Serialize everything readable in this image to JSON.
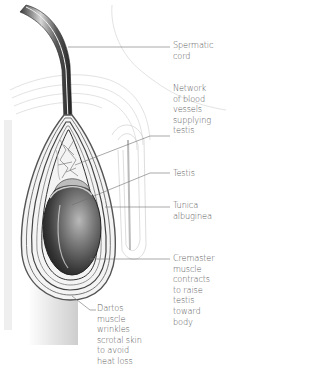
{
  "figure": {
    "colors": {
      "line": "#6e6e6e",
      "label_text": "#5a5a5a",
      "testis_dark": "#2e2e2e",
      "testis_mid": "#7a7a7a",
      "skin_fill": "#e8e8e8",
      "background": "#ffffff"
    }
  },
  "labels": [
    {
      "id": "spermatic-cord",
      "text": "Spermatic\ncord"
    },
    {
      "id": "blood-vessels",
      "text": "Network\nof blood\nvessels\nsupplying\ntestis"
    },
    {
      "id": "testis",
      "text": "Testis"
    },
    {
      "id": "tunica-albuginea",
      "text": "Tunica\nalbuginea"
    },
    {
      "id": "cremaster-muscle",
      "text": "Cremaster\nmuscle\ncontracts\nto raise\ntestis\ntoward\nbody"
    },
    {
      "id": "dartos-muscle",
      "text": "Dartos\nmuscle\nwrinkles\nscrotal skin\nto avoid\nheat loss"
    }
  ]
}
